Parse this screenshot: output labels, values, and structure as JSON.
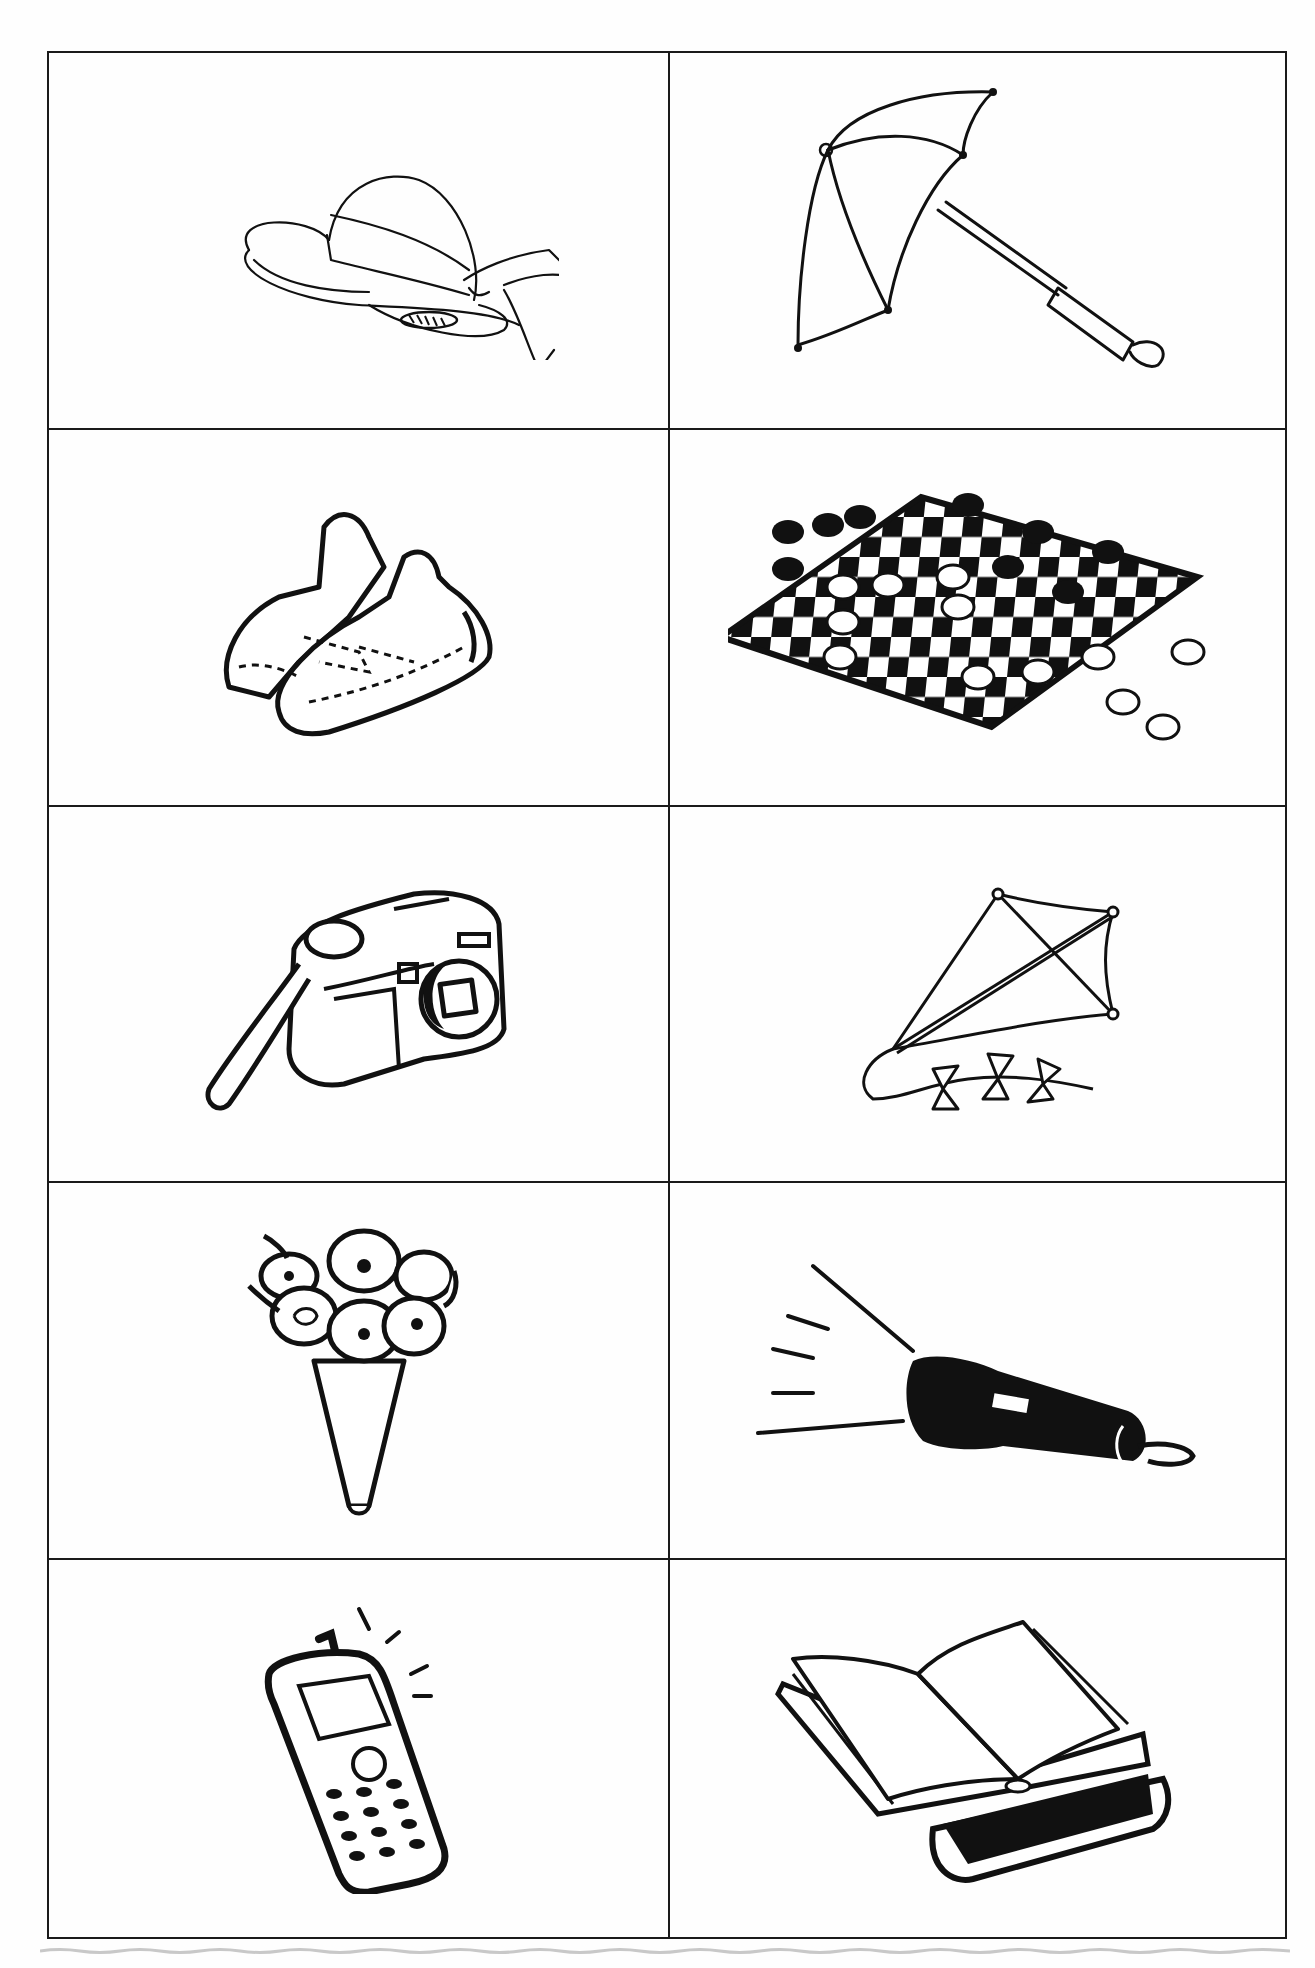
{
  "page": {
    "type": "picture-card-worksheet",
    "layout": {
      "columns": 2,
      "rows": 5
    },
    "line_color": "#1a1a1a",
    "background": "#ffffff"
  },
  "cards": [
    {
      "row": 0,
      "col": 0,
      "item": "hat",
      "description": "wide-brim sun hat with ribbon bow"
    },
    {
      "row": 0,
      "col": 1,
      "item": "umbrella",
      "description": "open umbrella with loop handle"
    },
    {
      "row": 1,
      "col": 0,
      "item": "sneakers",
      "description": "pair of velcro-strap sneakers"
    },
    {
      "row": 1,
      "col": 1,
      "item": "checkers",
      "description": "checkerboard with game pieces"
    },
    {
      "row": 2,
      "col": 0,
      "item": "camera",
      "description": "compact camera with wrist strap"
    },
    {
      "row": 2,
      "col": 1,
      "item": "kite",
      "description": "diamond kite with bow tail"
    },
    {
      "row": 3,
      "col": 0,
      "item": "bouquet",
      "description": "bouquet of flowers in paper cone"
    },
    {
      "row": 3,
      "col": 1,
      "item": "flashlight",
      "description": "flashlight with light beams"
    },
    {
      "row": 4,
      "col": 0,
      "item": "mobile-phone",
      "description": "ringing mobile phone with keypad"
    },
    {
      "row": 4,
      "col": 1,
      "item": "books",
      "description": "open book resting on closed book"
    }
  ]
}
